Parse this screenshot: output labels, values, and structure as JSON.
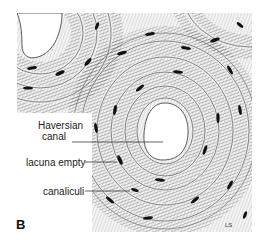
{
  "figure": {
    "panel_letter": "B",
    "labels": [
      {
        "id": "haversian",
        "line1": "Haversian",
        "line2": "canal"
      },
      {
        "id": "lacuna",
        "text": "lacuna empty"
      },
      {
        "id": "canaliculi",
        "text": "canaliculi"
      }
    ],
    "signature": "LS",
    "colors": {
      "ink": "#1a1a1a",
      "background": "#ffffff"
    }
  }
}
